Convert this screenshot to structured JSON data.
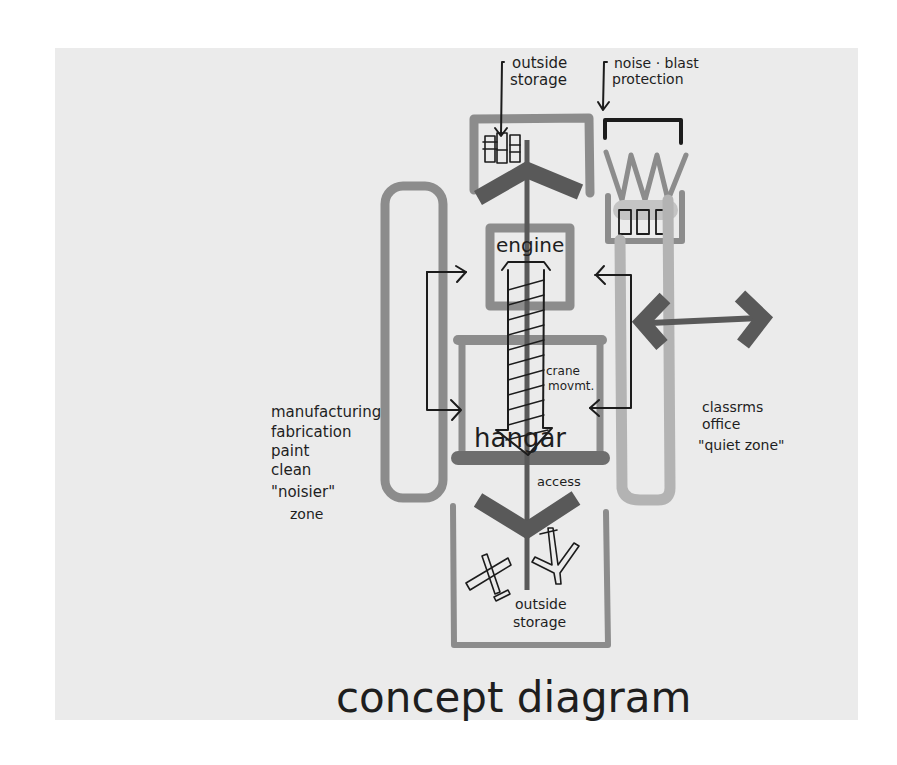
{
  "title": "concept diagram",
  "labels": {
    "top_outside_storage": [
      "outside",
      "storage"
    ],
    "noise_blast": [
      "noise · blast",
      "protection"
    ],
    "engine": "engine",
    "crane": [
      "crane",
      "movmt."
    ],
    "hangar": "hangar",
    "access": "access",
    "bottom_outside_storage": [
      "outside",
      "storage"
    ],
    "manufacturing_zone": [
      "manufacturing",
      "fabrication",
      "paint",
      "clean",
      "\"noisier\"",
      "zone"
    ],
    "quiet_zone": [
      "classrms",
      "office",
      "\"quiet zone\""
    ]
  },
  "colors": {
    "paper": "#ebebeb",
    "ink": "#1c1c1c",
    "marker_dark": "#595959",
    "marker_mid": "#8c8c8c",
    "marker_light": "#b3b3b3"
  }
}
